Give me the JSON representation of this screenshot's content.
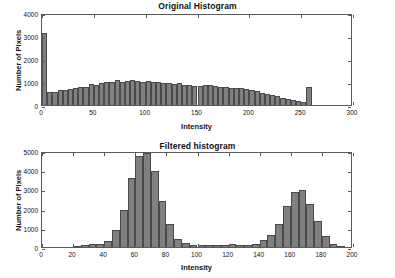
{
  "figure": {
    "background_color": "#ffffff",
    "bar_color": "#808080",
    "bar_edge_color": "#4a4a4a",
    "axis_color": "#5a5a5a"
  },
  "chart_data": [
    {
      "type": "bar",
      "id": "original-histogram",
      "title": "Original Histogram",
      "xlabel": "Intensity",
      "ylabel": "Number of Pixels",
      "xlim": [
        0,
        300
      ],
      "ylim": [
        0,
        4000
      ],
      "xticks": [
        0,
        50,
        100,
        150,
        200,
        250,
        300
      ],
      "xticklabels": [
        "0",
        "50",
        "100",
        "150",
        "200",
        "250",
        "300"
      ],
      "yticks": [
        0,
        1000,
        2000,
        3000,
        4000
      ],
      "yticklabels": [
        "0",
        "1000",
        "2000",
        "3000",
        "4000"
      ],
      "grid": false,
      "legend": null,
      "bin_width": 5,
      "x": [
        0,
        5,
        10,
        15,
        20,
        25,
        30,
        35,
        40,
        45,
        50,
        55,
        60,
        65,
        70,
        75,
        80,
        85,
        90,
        95,
        100,
        105,
        110,
        115,
        120,
        125,
        130,
        135,
        140,
        145,
        150,
        155,
        160,
        165,
        170,
        175,
        180,
        185,
        190,
        195,
        200,
        205,
        210,
        215,
        220,
        225,
        230,
        235,
        240,
        245,
        250,
        255
      ],
      "values": [
        3150,
        555,
        580,
        640,
        660,
        700,
        720,
        790,
        800,
        900,
        880,
        960,
        1010,
        1020,
        1070,
        1010,
        1055,
        1070,
        1030,
        1010,
        1050,
        980,
        1015,
        960,
        955,
        935,
        960,
        880,
        890,
        845,
        830,
        870,
        880,
        810,
        800,
        775,
        760,
        745,
        720,
        700,
        650,
        620,
        530,
        500,
        450,
        390,
        320,
        260,
        220,
        175,
        110,
        800
      ]
    },
    {
      "type": "bar",
      "id": "filtered-histogram",
      "title": "Filtered histogram",
      "xlabel": "Intensity",
      "ylabel": "Number of Pixels",
      "xlim": [
        0,
        200
      ],
      "ylim": [
        0,
        5000
      ],
      "xticks": [
        0,
        20,
        40,
        60,
        80,
        100,
        120,
        140,
        160,
        180,
        200
      ],
      "xticklabels": [
        "0",
        "20",
        "40",
        "60",
        "80",
        "100",
        "120",
        "140",
        "160",
        "180",
        "200"
      ],
      "yticks": [
        0,
        1000,
        2000,
        3000,
        4000,
        5000
      ],
      "yticklabels": [
        "0",
        "1000",
        "2000",
        "3000",
        "4000",
        "5000"
      ],
      "grid": false,
      "legend": null,
      "bin_width": 5,
      "x": [
        20,
        25,
        30,
        35,
        40,
        45,
        50,
        55,
        60,
        65,
        70,
        75,
        80,
        85,
        90,
        95,
        100,
        105,
        110,
        115,
        120,
        125,
        130,
        135,
        140,
        145,
        150,
        155,
        160,
        165,
        170,
        175,
        180,
        185,
        190
      ],
      "values": [
        40,
        130,
        150,
        160,
        330,
        890,
        1950,
        3590,
        4730,
        4900,
        3960,
        2400,
        1200,
        430,
        200,
        120,
        95,
        90,
        95,
        130,
        140,
        80,
        90,
        160,
        370,
        650,
        1220,
        2140,
        2850,
        2960,
        2230,
        1330,
        560,
        160,
        40
      ]
    }
  ]
}
